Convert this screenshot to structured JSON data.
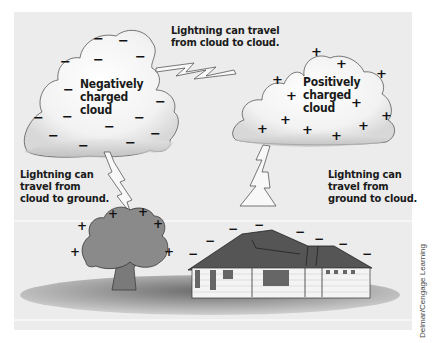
{
  "figure": {
    "background_color": "#ececec",
    "labels": {
      "cloud_to_cloud": "Lightning can travel\nfrom cloud to cloud.",
      "negative_cloud": "Negatively\ncharged\ncloud",
      "positive_cloud": "Positively\ncharged\ncloud",
      "cloud_to_ground": "Lightning can\ntravel from\ncloud to ground.",
      "ground_to_cloud": "Lightning can\ntravel from\nground to cloud."
    },
    "symbols": {
      "negative": "−",
      "positive": "+"
    },
    "credit": "Delmar/Cengage Learning"
  }
}
